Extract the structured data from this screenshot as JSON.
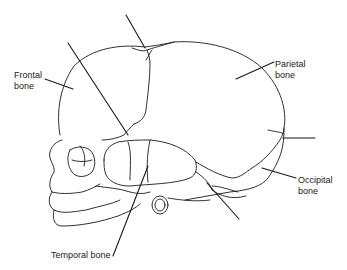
{
  "diagram": {
    "labels": [
      {
        "id": "frontal",
        "text": "Frontal\nbone",
        "x": 14,
        "y": 70
      },
      {
        "id": "parietal",
        "text": "Parietal\nbone",
        "x": 275,
        "y": 59
      },
      {
        "id": "occipital",
        "text": "Occipital\nbone",
        "x": 298,
        "y": 175
      },
      {
        "id": "temporal",
        "text": "Temporal bone",
        "x": 51,
        "y": 250
      }
    ],
    "leader_lines": [
      {
        "to": "frontal",
        "x1": 45,
        "y1": 79,
        "x2": 73,
        "y2": 89
      },
      {
        "to": "parietal",
        "x1": 274,
        "y1": 62,
        "x2": 236,
        "y2": 79
      },
      {
        "to": "occipital",
        "x1": 296,
        "y1": 178,
        "x2": 262,
        "y2": 168
      },
      {
        "to": "temporal",
        "x1": 113,
        "y1": 256,
        "x2": 148,
        "y2": 166
      },
      {
        "to": "anterior-fontanel",
        "x1": 126,
        "y1": 15,
        "x2": 145,
        "y2": 48
      },
      {
        "to": "coronal-suture",
        "x1": 68,
        "y1": 43,
        "x2": 128,
        "y2": 135
      },
      {
        "to": "lambdoid-suture",
        "x1": 283,
        "y1": 138,
        "x2": 315,
        "y2": 138
      },
      {
        "to": "mastoid-fontanel",
        "x1": 207,
        "y1": 183,
        "x2": 239,
        "y2": 219
      }
    ],
    "colors": {
      "stroke": "#1a1a1a",
      "background": "#ffffff"
    }
  }
}
